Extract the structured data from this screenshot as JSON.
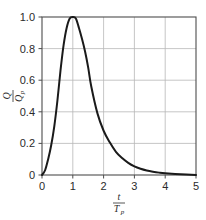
{
  "chart_data": {
    "type": "line",
    "title": "",
    "subtitle": "",
    "xlabel": "t / Tp",
    "ylabel": "Q / Qp",
    "xlabel_num": "t",
    "xlabel_den": "T",
    "xlabel_den_sub": "p",
    "ylabel_num": "Q",
    "ylabel_den": "Q",
    "ylabel_den_sub": "p",
    "xlim": [
      0,
      5
    ],
    "ylim": [
      0,
      1.0
    ],
    "grid": true,
    "legend": "none",
    "xticks": [
      0,
      1,
      2,
      3,
      4,
      5
    ],
    "xtick_labels": [
      "0",
      "1",
      "2",
      "3",
      "4",
      "5"
    ],
    "yticks": [
      0,
      0.2,
      0.4,
      0.6,
      0.8,
      1.0
    ],
    "ytick_labels": [
      "0",
      "0.2",
      "0.4",
      "0.6",
      "0.8",
      "1.0"
    ],
    "series": [
      {
        "name": "SCS dimensionless unit hydrograph",
        "x": [
          0,
          0.1,
          0.2,
          0.3,
          0.4,
          0.5,
          0.6,
          0.7,
          0.8,
          0.9,
          1.0,
          1.1,
          1.2,
          1.3,
          1.4,
          1.5,
          1.6,
          1.8,
          2.0,
          2.2,
          2.4,
          2.6,
          2.8,
          3.0,
          3.2,
          3.4,
          3.6,
          3.8,
          4.0,
          4.5,
          5.0
        ],
        "y": [
          0.0,
          0.03,
          0.1,
          0.19,
          0.31,
          0.47,
          0.66,
          0.82,
          0.93,
          0.99,
          1.0,
          0.99,
          0.93,
          0.86,
          0.78,
          0.68,
          0.56,
          0.39,
          0.28,
          0.207,
          0.147,
          0.107,
          0.077,
          0.055,
          0.04,
          0.029,
          0.021,
          0.015,
          0.011,
          0.005,
          0.0
        ]
      }
    ],
    "colors": {
      "curve": "#1a1a1a",
      "grid": "#b8b8b8",
      "frame": "#4d4d4d",
      "text": "#2b2b2b",
      "background": "#ffffff"
    },
    "geometry": {
      "left": 42,
      "right": 196,
      "top": 17,
      "bottom": 175
    }
  }
}
